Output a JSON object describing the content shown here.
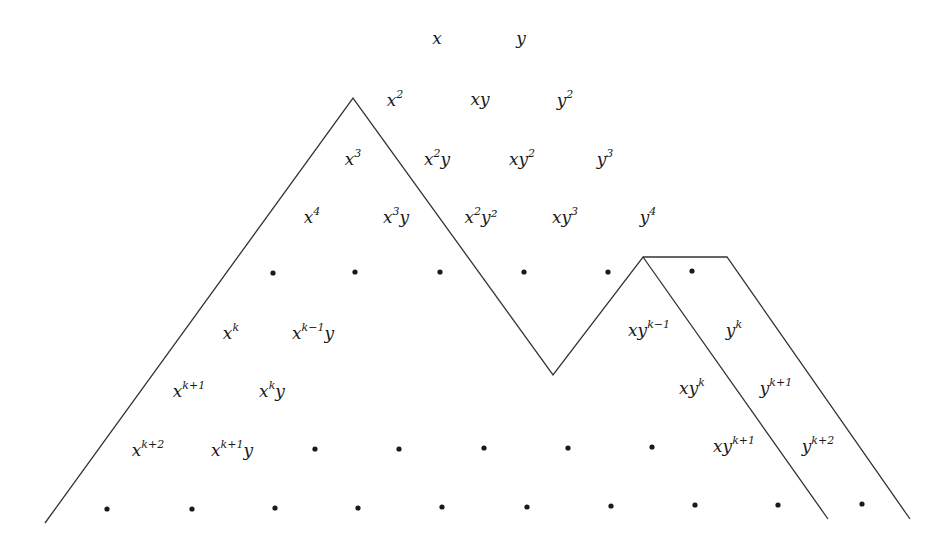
{
  "diagram": {
    "line_color": "#333333",
    "dot_color": "#1a1a1a",
    "terms": [
      {
        "id": "x",
        "base": "x",
        "exp": "",
        "tail": "",
        "cx": 437,
        "cy": 38
      },
      {
        "id": "y",
        "base": "y",
        "exp": "",
        "tail": "",
        "cx": 521,
        "cy": 38
      },
      {
        "id": "x2",
        "base": "x",
        "exp": "2",
        "tail": "",
        "cx": 395,
        "cy": 100
      },
      {
        "id": "xy",
        "base": "xy",
        "exp": "",
        "tail": "",
        "cx": 480,
        "cy": 99
      },
      {
        "id": "y2",
        "base": "y",
        "exp": "2",
        "tail": "",
        "cx": 565,
        "cy": 100
      },
      {
        "id": "x3",
        "base": "x",
        "exp": "3",
        "tail": "",
        "cx": 353,
        "cy": 159
      },
      {
        "id": "x2y",
        "base": "x",
        "exp": "2",
        "tail": "y",
        "cx": 437,
        "cy": 159
      },
      {
        "id": "xy2",
        "base": "xy",
        "exp": "2",
        "tail": "",
        "cx": 522,
        "cy": 159
      },
      {
        "id": "y3",
        "base": "y",
        "exp": "3",
        "tail": "",
        "cx": 605,
        "cy": 159
      },
      {
        "id": "x4",
        "base": "x",
        "exp": "4",
        "tail": "",
        "cx": 312,
        "cy": 217
      },
      {
        "id": "x3y",
        "base": "x",
        "exp": "3",
        "tail": "y",
        "cx": 396,
        "cy": 217
      },
      {
        "id": "x2y2",
        "base": "x",
        "exp": "2",
        "tail": "y²",
        "cx": 481,
        "cy": 217
      },
      {
        "id": "xy3",
        "base": "xy",
        "exp": "3",
        "tail": "",
        "cx": 565,
        "cy": 217
      },
      {
        "id": "y4",
        "base": "y",
        "exp": "4",
        "tail": "",
        "cx": 648,
        "cy": 217
      },
      {
        "id": "xk",
        "base": "x",
        "exp": "k",
        "tail": "",
        "cx": 231,
        "cy": 333
      },
      {
        "id": "xk-1y",
        "base": "x",
        "exp": "k−1",
        "tail": "y",
        "cx": 313,
        "cy": 333
      },
      {
        "id": "xyk-1",
        "base": "xy",
        "exp": "k−1",
        "tail": "",
        "cx": 649,
        "cy": 330
      },
      {
        "id": "yk",
        "base": "y",
        "exp": "k",
        "tail": "",
        "cx": 734,
        "cy": 330
      },
      {
        "id": "xk+1",
        "base": "x",
        "exp": "k+1",
        "tail": "",
        "cx": 189,
        "cy": 391
      },
      {
        "id": "xky",
        "base": "x",
        "exp": "k",
        "tail": "y",
        "cx": 272,
        "cy": 391
      },
      {
        "id": "xyk",
        "base": "xy",
        "exp": "k",
        "tail": "",
        "cx": 692,
        "cy": 388
      },
      {
        "id": "yk+1",
        "base": "y",
        "exp": "k+1",
        "tail": "",
        "cx": 776,
        "cy": 388
      },
      {
        "id": "xk+2",
        "base": "x",
        "exp": "k+2",
        "tail": "",
        "cx": 148,
        "cy": 450
      },
      {
        "id": "xk+1y",
        "base": "x",
        "exp": "k+1",
        "tail": "y",
        "cx": 232,
        "cy": 450
      },
      {
        "id": "xyk+1",
        "base": "xy",
        "exp": "k+1",
        "tail": "",
        "cx": 734,
        "cy": 446
      },
      {
        "id": "yk+2",
        "base": "y",
        "exp": "k+2",
        "tail": "",
        "cx": 818,
        "cy": 446
      }
    ],
    "dots": [
      {
        "cx": 273,
        "cy": 273
      },
      {
        "cx": 355,
        "cy": 272
      },
      {
        "cx": 440,
        "cy": 272
      },
      {
        "cx": 524,
        "cy": 272
      },
      {
        "cx": 608,
        "cy": 272
      },
      {
        "cx": 692,
        "cy": 271
      },
      {
        "cx": 315,
        "cy": 449
      },
      {
        "cx": 399,
        "cy": 449
      },
      {
        "cx": 484,
        "cy": 448
      },
      {
        "cx": 568,
        "cy": 448
      },
      {
        "cx": 652,
        "cy": 447
      },
      {
        "cx": 107,
        "cy": 509
      },
      {
        "cx": 192,
        "cy": 509
      },
      {
        "cx": 275,
        "cy": 508
      },
      {
        "cx": 358,
        "cy": 508
      },
      {
        "cx": 442,
        "cy": 507
      },
      {
        "cx": 527,
        "cy": 507
      },
      {
        "cx": 611,
        "cy": 506
      },
      {
        "cx": 695,
        "cy": 505
      },
      {
        "cx": 778,
        "cy": 505
      },
      {
        "cx": 862,
        "cy": 504
      }
    ],
    "polylines": [
      {
        "id": "main-boundary",
        "points": "45,523 353,98 553,375 643,257 828,519"
      },
      {
        "id": "flat-top",
        "points": "643,257 727,257 910,519"
      }
    ]
  }
}
